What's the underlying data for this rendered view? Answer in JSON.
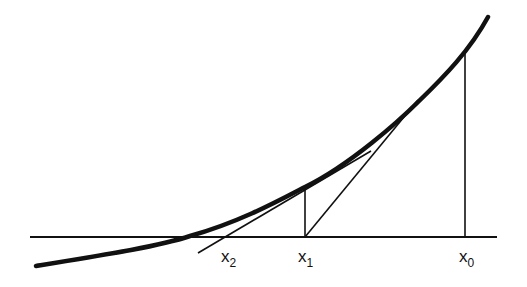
{
  "diagram": {
    "colors": {
      "ink": "#111111",
      "background": "#ffffff"
    },
    "axis": {
      "x1": 30,
      "x2": 497,
      "y": 237
    },
    "curve": {
      "path": "M 36 266 C 110 254, 160 246, 190 236 C 240 222, 280 200, 305 187 C 350 165, 400 120, 418 102 C 445 76, 470 50, 488 17"
    },
    "points": [
      {
        "name": "x0",
        "label": "x",
        "sub": "0",
        "x": 465,
        "curve_y": 50,
        "label_x": 459,
        "label_y": 262
      },
      {
        "name": "x1",
        "label": "x",
        "sub": "1",
        "x": 305,
        "curve_y": 187,
        "label_x": 298,
        "label_y": 262
      },
      {
        "name": "x2",
        "label": "x",
        "sub": "2",
        "x": 226,
        "label_x": 221,
        "label_y": 262
      }
    ],
    "tangents": [
      {
        "name": "tangent-at-x0",
        "x1": 305,
        "y1": 237,
        "x2": 418,
        "y2": 100
      },
      {
        "name": "tangent-at-x1",
        "x1": 198,
        "y1": 253,
        "x2": 371,
        "y2": 151
      }
    ]
  }
}
